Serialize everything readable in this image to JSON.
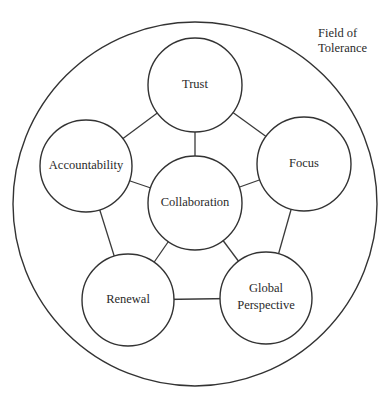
{
  "diagram": {
    "type": "network",
    "field_label": {
      "lines": [
        "Field of",
        "Tolerance"
      ]
    },
    "outer_circle": {
      "cx": 195,
      "cy": 204,
      "r": 182
    },
    "nodes": [
      {
        "id": "trust",
        "label_lines": [
          "Trust"
        ],
        "cx": 195,
        "cy": 85,
        "r": 47
      },
      {
        "id": "focus",
        "label_lines": [
          "Focus"
        ],
        "cx": 304,
        "cy": 164,
        "r": 47
      },
      {
        "id": "global",
        "label_lines": [
          "Global",
          "Perspective"
        ],
        "cx": 266,
        "cy": 298,
        "r": 46
      },
      {
        "id": "renewal",
        "label_lines": [
          "Renewal"
        ],
        "cx": 128,
        "cy": 300,
        "r": 46
      },
      {
        "id": "accountability",
        "label_lines": [
          "Accountability"
        ],
        "cx": 86,
        "cy": 166,
        "r": 46
      },
      {
        "id": "collaboration",
        "label_lines": [
          "Collaboration"
        ],
        "cx": 195,
        "cy": 203,
        "r": 47
      }
    ],
    "edges": [
      [
        "trust",
        "focus"
      ],
      [
        "focus",
        "global"
      ],
      [
        "global",
        "renewal"
      ],
      [
        "renewal",
        "accountability"
      ],
      [
        "accountability",
        "trust"
      ],
      [
        "collaboration",
        "trust"
      ],
      [
        "collaboration",
        "focus"
      ],
      [
        "collaboration",
        "global"
      ],
      [
        "collaboration",
        "renewal"
      ],
      [
        "collaboration",
        "accountability"
      ]
    ],
    "colors": {
      "stroke": "#333333",
      "fill": "#ffffff",
      "text": "#2a2a2a"
    }
  }
}
